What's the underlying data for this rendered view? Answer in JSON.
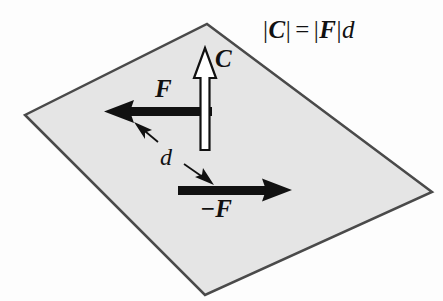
{
  "figure": {
    "canvas": {
      "width": 443,
      "height": 301,
      "background": "#fdfdfd"
    },
    "plane": {
      "name": "shaded-plane-parallelogram",
      "points": "207,24 432,192 205,295 25,115",
      "fill": "#e5e5e5",
      "stroke": "#4a4a4a",
      "stroke_width": 2.5
    },
    "equation": {
      "text": "|C| = |F|d",
      "lhs_bar_open": "|",
      "lhs_vector": "C",
      "lhs_bar_close": "|",
      "operator": "=",
      "rhs_bar_open": "|",
      "rhs_vector": "F",
      "rhs_bar_close": "|",
      "rhs_scalar": "d"
    },
    "vectors": [
      {
        "name": "couple-moment-vector-C",
        "label": "C",
        "style": "hollow-outline",
        "fill": "#ffffff",
        "stroke": "#111111",
        "direction": "up",
        "tail": [
          205,
          150
        ],
        "tip": [
          205,
          48
        ]
      },
      {
        "name": "force-vector-F",
        "label": "F",
        "style": "solid",
        "fill": "#111111",
        "direction": "left",
        "tail": [
          212,
          112
        ],
        "tip": [
          104,
          112
        ]
      },
      {
        "name": "force-vector-minus-F",
        "label": "−F",
        "style": "solid",
        "fill": "#111111",
        "direction": "right",
        "tail": [
          178,
          190
        ],
        "tip": [
          292,
          190
        ]
      }
    ],
    "dimension": {
      "name": "separation-distance-d",
      "label": "d",
      "style": "double-headed-arrow",
      "stroke": "#111111",
      "from": [
        136,
        124
      ],
      "to": [
        218,
        182
      ]
    }
  }
}
